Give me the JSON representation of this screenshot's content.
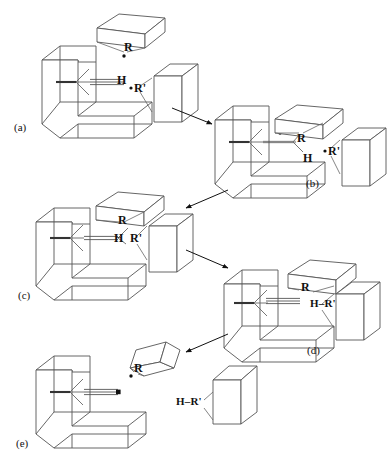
{
  "figure": {
    "type": "reaction-mechanism-diagram",
    "background_color": "#ffffff",
    "line_color": "#4a4a4a",
    "text_color": "#111111",
    "width": 388,
    "height": 462
  },
  "panels": [
    {
      "id": "a",
      "label": "(a)",
      "label_pos": {
        "x": 14,
        "y": 122
      },
      "species": [
        {
          "name": "host-cavity-block",
          "kind": "u-shaped-block"
        },
        {
          "name": "alkyne-substrate",
          "bond": "triple",
          "terminus": "H"
        },
        {
          "name": "r-group-block",
          "kind": "flat-parallelepiped",
          "label": "R",
          "radical": true
        },
        {
          "name": "r-prime-block",
          "kind": "tall-box",
          "label": "R'",
          "radical": true
        }
      ],
      "labels": [
        {
          "text": "R",
          "x": 124,
          "y": 47,
          "kind": "atom"
        },
        {
          "text": "H",
          "x": 117,
          "y": 80,
          "kind": "atom"
        },
        {
          "text": "R'",
          "x": 138,
          "y": 89,
          "kind": "atom"
        }
      ]
    },
    {
      "id": "b",
      "label": "(b)",
      "label_pos": {
        "x": 306,
        "y": 178
      },
      "species": [
        {
          "name": "host-cavity-block",
          "kind": "u-shaped-block"
        },
        {
          "name": "vinyl-radical",
          "bond": "single",
          "radical": true,
          "substituents": [
            "R",
            "H"
          ]
        },
        {
          "name": "r-group-block",
          "kind": "flat-parallelepiped",
          "label": "R"
        },
        {
          "name": "r-prime-block",
          "kind": "tall-box",
          "label": "R'",
          "radical": true
        }
      ],
      "labels": [
        {
          "text": "R",
          "x": 297,
          "y": 138,
          "kind": "atom"
        },
        {
          "text": "H",
          "x": 303,
          "y": 158,
          "kind": "atom"
        },
        {
          "text": "R'",
          "x": 330,
          "y": 152,
          "kind": "atom"
        }
      ]
    },
    {
      "id": "c",
      "label": "(c)",
      "label_pos": {
        "x": 18,
        "y": 290
      },
      "species": [
        {
          "name": "host-cavity-block",
          "kind": "u-shaped-block"
        },
        {
          "name": "alkene-product",
          "bond": "double",
          "substituents": [
            "R",
            "H"
          ]
        },
        {
          "name": "r-group-block",
          "kind": "flat-parallelepiped",
          "label": "R"
        },
        {
          "name": "r-prime-block",
          "kind": "tall-box",
          "label": "R'"
        }
      ],
      "labels": [
        {
          "text": "R",
          "x": 118,
          "y": 220,
          "kind": "atom"
        },
        {
          "text": "H",
          "x": 116,
          "y": 238,
          "kind": "atom"
        },
        {
          "text": "R'",
          "x": 133,
          "y": 238,
          "kind": "atom"
        }
      ]
    },
    {
      "id": "d",
      "label": "(d)",
      "label_pos": {
        "x": 307,
        "y": 345
      },
      "species": [
        {
          "name": "host-cavity-block",
          "kind": "u-shaped-block"
        },
        {
          "name": "alkyne-substrate",
          "bond": "triple",
          "terminus": "R"
        },
        {
          "name": "r-group-block",
          "kind": "flat-parallelepiped",
          "label": "R"
        },
        {
          "name": "hr-prime-block",
          "kind": "tall-box",
          "label": "H–R'"
        }
      ],
      "labels": [
        {
          "text": "R",
          "x": 301,
          "y": 287,
          "kind": "atom"
        },
        {
          "text": "H–R'",
          "x": 320,
          "y": 303,
          "kind": "hr"
        }
      ]
    },
    {
      "id": "e",
      "label": "(e)",
      "label_pos": {
        "x": 16,
        "y": 438
      },
      "species": [
        {
          "name": "host-cavity-block",
          "kind": "u-shaped-block"
        },
        {
          "name": "alkynyl-radical",
          "bond": "triple",
          "radical": true
        },
        {
          "name": "r-group-block",
          "kind": "flat-parallelepiped",
          "label": "R",
          "radical": true
        },
        {
          "name": "hr-prime-block",
          "kind": "tall-box",
          "label": "H–R'"
        }
      ],
      "labels": [
        {
          "text": "R",
          "x": 134,
          "y": 368,
          "kind": "atom"
        },
        {
          "text": "H–R'",
          "x": 190,
          "y": 403,
          "kind": "hr"
        }
      ]
    }
  ],
  "arrows": [
    {
      "name": "arrow-a-to-b",
      "from": "a",
      "to": "b",
      "x1": 172,
      "y1": 108,
      "x2": 212,
      "y2": 124
    },
    {
      "name": "arrow-b-to-c",
      "from": "b",
      "to": "c",
      "x1": 228,
      "y1": 190,
      "x2": 186,
      "y2": 208
    },
    {
      "name": "arrow-c-to-d",
      "from": "c",
      "to": "d",
      "x1": 186,
      "y1": 250,
      "x2": 228,
      "y2": 268
    },
    {
      "name": "arrow-d-to-e",
      "from": "d",
      "to": "e",
      "x1": 228,
      "y1": 334,
      "x2": 186,
      "y2": 352
    }
  ]
}
